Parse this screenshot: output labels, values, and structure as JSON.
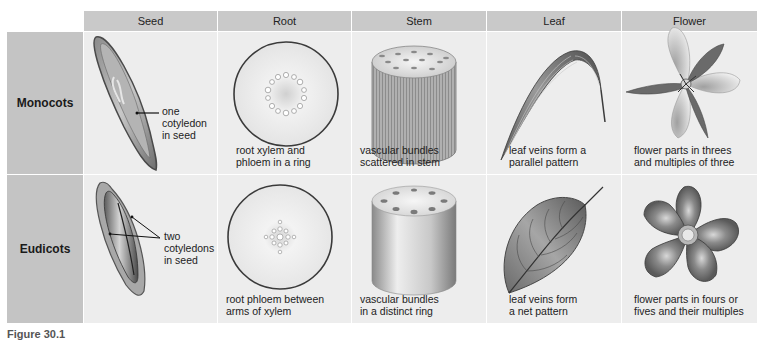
{
  "columns": [
    "Seed",
    "Root",
    "Stem",
    "Leaf",
    "Flower"
  ],
  "rows": [
    {
      "label": "Monocots",
      "seed_label": [
        "one",
        "cotyledon",
        "in seed"
      ],
      "root_caption": [
        "root xylem and",
        "phloem in a ring"
      ],
      "stem_caption": [
        "vascular bundles",
        "scattered in stem"
      ],
      "leaf_caption": [
        "leaf veins form a",
        "parallel pattern"
      ],
      "flower_caption": [
        "flower parts in threes",
        "and multiples of three"
      ]
    },
    {
      "label": "Eudicots",
      "seed_label": [
        "two",
        "cotyledons",
        "in seed"
      ],
      "root_caption": [
        "root phloem between",
        "arms of xylem"
      ],
      "stem_caption": [
        "vascular bundles",
        "in a distinct ring"
      ],
      "leaf_caption": [
        "leaf veins form",
        "a net pattern"
      ],
      "flower_caption": [
        "flower parts in fours or",
        "fives and their multiples"
      ]
    }
  ],
  "figure_caption": "Figure 30.1",
  "colors": {
    "header_bg": "#c9c9c9",
    "rowhead_bg": "#c4c4c4",
    "cell_bg": "#ededed"
  }
}
